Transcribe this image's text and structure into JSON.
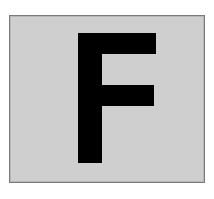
{
  "sign": {
    "letter": "F",
    "background_color": "#cfcfcf",
    "border_color": "#7a7a7a",
    "letter_color": "#000000"
  }
}
